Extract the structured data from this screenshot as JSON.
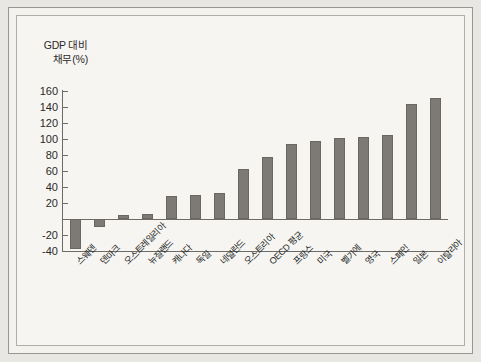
{
  "chart_data": {
    "type": "bar",
    "title": "",
    "subtitle": "",
    "ylabel_line1": "GDP 대비",
    "ylabel_line2": "채무(%)",
    "xlabel": "",
    "ylim": [
      -40,
      160
    ],
    "yticks": [
      160,
      140,
      120,
      100,
      80,
      60,
      40,
      20,
      0,
      -20,
      -40
    ],
    "ytick_labels": [
      "160",
      "140",
      "120",
      "100",
      "80",
      "60",
      "40",
      "20",
      "",
      "-20",
      "-40"
    ],
    "grid": false,
    "legend": "none",
    "bar_color": "#7d7a76",
    "bar_edge_color": "#6a6763",
    "zero_line": true,
    "categories": [
      "스웨덴",
      "덴마크",
      "오스트레일리아",
      "뉴질랜드",
      "캐나다",
      "독일",
      "네덜란드",
      "오스트리아",
      "OECD 평균",
      "프랑스",
      "미국",
      "벨기에",
      "영국",
      "스페인",
      "일본",
      "이탈리아"
    ],
    "values": [
      -38,
      -10,
      5,
      6,
      29,
      30,
      33,
      62,
      77,
      94,
      98,
      101,
      103,
      105,
      144,
      151
    ]
  }
}
